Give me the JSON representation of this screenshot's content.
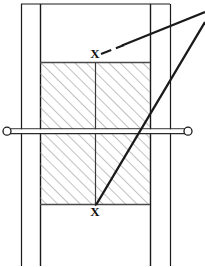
{
  "figure": {
    "type": "technical-engineering-drawing",
    "title": "",
    "background_color": "#ffffff",
    "line_color": "#1a1a1a",
    "hatch_color": "#8d8d8d",
    "width": 205,
    "height": 267
  },
  "labels": {
    "section_mark_top": "X",
    "section_mark_bottom": "X"
  },
  "geometry": {
    "outer_frame": {
      "left_outer_x": 21,
      "left_inner_x": 40,
      "right_inner_x": 150,
      "right_outer_x": 170,
      "top_y": 4,
      "bottom_y": 263
    },
    "hatched_block": {
      "x": 40,
      "y": 62,
      "width": 110,
      "height": 142,
      "hatch_angle_deg": 45,
      "hatch_spacing_px": 8
    },
    "center_line": {
      "x": 95,
      "y_top": 62,
      "y_bottom": 204
    },
    "horizontal_rod": {
      "y_center": 131,
      "x_left_end": 7,
      "x_right_end": 188,
      "thickness": 5,
      "end_cap": "open-circle",
      "end_cap_radius": 4
    },
    "leader_dashed": {
      "from_x": 101,
      "from_y": 54,
      "to_x": 205,
      "to_y": 12,
      "style": "dashed-then-solid"
    },
    "leader_solid": {
      "from_x": 96,
      "from_y": 204,
      "to_x": 205,
      "to_y": 22,
      "style": "solid"
    },
    "label_positions": {
      "top_x_label": {
        "x": 95,
        "y": 58
      },
      "bottom_x_label": {
        "x": 95,
        "y": 216
      }
    }
  }
}
